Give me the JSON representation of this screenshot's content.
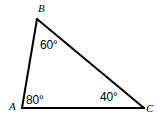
{
  "figure": {
    "kind": "triangle-angle-diagram",
    "background_color": "#ffffff",
    "stroke_color": "#000000",
    "text_color": "#000000",
    "width": 158,
    "height": 119
  },
  "vertices": [
    {
      "id": "A",
      "label": "A",
      "x": 22,
      "y": 108
    },
    {
      "id": "B",
      "label": "B",
      "x": 37,
      "y": 19
    },
    {
      "id": "C",
      "label": "C",
      "x": 144,
      "y": 108
    }
  ],
  "sides": [
    {
      "id": "AB",
      "from": "A",
      "to": "B"
    },
    {
      "id": "BC",
      "from": "B",
      "to": "C"
    },
    {
      "id": "AC",
      "from": "A",
      "to": "C"
    }
  ],
  "angles": [
    {
      "at": "A",
      "label": "80°",
      "value": 80
    },
    {
      "at": "B",
      "label": "60°",
      "value": 60
    },
    {
      "at": "C",
      "label": "40°",
      "value": 40
    }
  ]
}
